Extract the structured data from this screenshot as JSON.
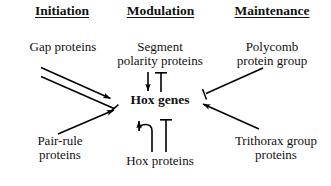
{
  "figure": {
    "background_color": "#ffffff",
    "stroke_color": "#000000",
    "text_color": "#111111"
  },
  "columns": {
    "initiation": "Initiation",
    "modulation": "Modulation",
    "maintenance": "Maintenance"
  },
  "nodes": {
    "gap_proteins": "Gap proteins",
    "segment_polarity": "Segment\npolarity proteins",
    "polycomb": "Polycomb\nprotein group",
    "pair_rule": "Pair-rule\nproteins",
    "hox_genes": "Hox genes",
    "hox_proteins": "Hox proteins",
    "trithorax": "Trithorax group\nproteins"
  },
  "edges": [
    {
      "id": "gap-activates-hox",
      "from": "gap_proteins",
      "to": "hox_genes",
      "type": "activation",
      "head": "arrowhead"
    },
    {
      "id": "gap-inhibits-hox",
      "from": "gap_proteins",
      "to": "hox_genes",
      "type": "inhibition",
      "head": "t-bar"
    },
    {
      "id": "pair-rule-activates-hox",
      "from": "pair_rule",
      "to": "hox_genes",
      "type": "activation",
      "head": "arrowhead"
    },
    {
      "id": "segment-polarity-activates-hox",
      "from": "segment_polarity",
      "to": "hox_genes",
      "type": "activation",
      "head": "arrowhead"
    },
    {
      "id": "segment-polarity-inhibits-hox",
      "from": "segment_polarity",
      "to": "hox_genes",
      "type": "inhibition",
      "head": "t-bar"
    },
    {
      "id": "hox-genes-to-hox-proteins",
      "from": "hox_genes",
      "to": "hox_proteins",
      "type": "inhibition",
      "head": "t-bar"
    },
    {
      "id": "hox-proteins-activates-hox-genes",
      "from": "hox_proteins",
      "to": "hox_genes",
      "type": "activation",
      "head": "arrowhead"
    },
    {
      "id": "polycomb-inhibits-hox",
      "from": "polycomb",
      "to": "hox_genes",
      "type": "inhibition",
      "head": "t-bar"
    },
    {
      "id": "trithorax-activates-hox",
      "from": "trithorax",
      "to": "hox_genes",
      "type": "activation",
      "head": "arrowhead"
    }
  ]
}
